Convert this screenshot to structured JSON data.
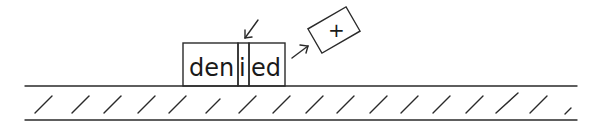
{
  "diagram": {
    "word": "denied",
    "segments": [
      {
        "text": "den"
      },
      {
        "text": "i"
      },
      {
        "text": "ed"
      }
    ],
    "tile": {
      "text": "+"
    },
    "colors": {
      "ink": "#2a2a2a",
      "background": "#ffffff"
    }
  }
}
